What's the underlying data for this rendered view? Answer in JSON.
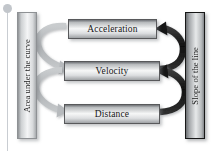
{
  "diagram": {
    "left_label": "Area under the curve",
    "right_label": "Slope of the line",
    "nodes": [
      {
        "id": "acceleration",
        "label": "Acceleration"
      },
      {
        "id": "velocity",
        "label": "Velocity"
      },
      {
        "id": "distance",
        "label": "Distance"
      }
    ],
    "edges": [
      {
        "id": "accel-to-velocity",
        "from": "Acceleration",
        "to": "Velocity",
        "side": "left",
        "relation": "Area under the curve",
        "color": "#b4b7ba"
      },
      {
        "id": "velocity-to-distance",
        "from": "Velocity",
        "to": "Distance",
        "side": "left",
        "relation": "Area under the curve",
        "color": "#b4b7ba"
      },
      {
        "id": "velocity-to-accel",
        "from": "Velocity",
        "to": "Acceleration",
        "side": "right",
        "relation": "Slope of the line",
        "color": "#1b1b1b"
      },
      {
        "id": "distance-to-velocity",
        "from": "Distance",
        "to": "Velocity",
        "side": "right",
        "relation": "Slope of the line",
        "color": "#1b1b1b"
      }
    ],
    "colors": {
      "background": "#ffffff",
      "left_arrow": "#b4b7ba",
      "right_arrow": "#1b1b1b",
      "box_border": "#58595b",
      "right_box_border": "#171717",
      "text": "#151515",
      "pin": "#c5c9ce"
    },
    "marker": {
      "name": "slide-pin-marker"
    }
  }
}
